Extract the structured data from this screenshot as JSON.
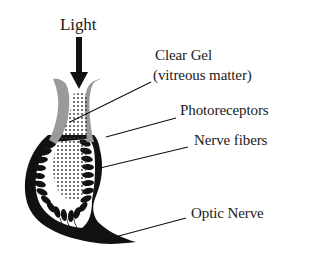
{
  "diagram": {
    "type": "labeled-illustration",
    "labels": {
      "light": "Light",
      "clear_gel_line1": "Clear Gel",
      "clear_gel_line2": "(vitreous matter)",
      "photoreceptors": "Photoreceptors",
      "nerve_fibers": "Nerve fibers",
      "optic_nerve": "Optic Nerve"
    },
    "colors": {
      "ink": "#111111",
      "gray_tissue": "#9a9a9a",
      "gel_dots": "#333333",
      "background": "#ffffff"
    }
  }
}
